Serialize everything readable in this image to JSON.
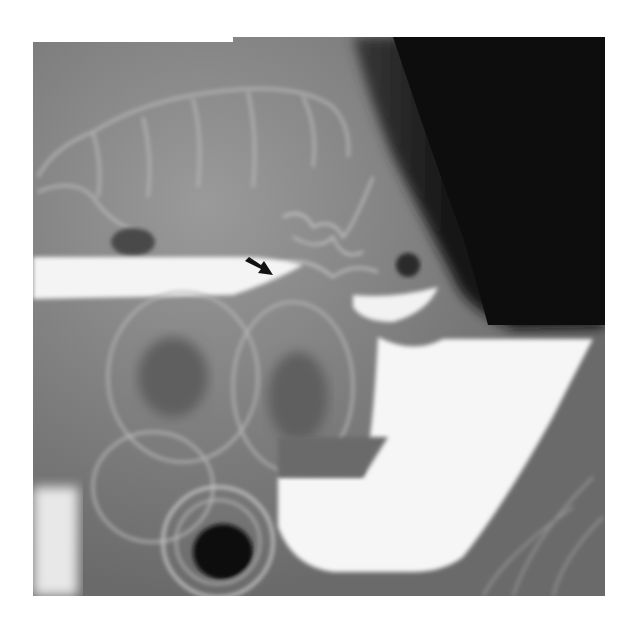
{
  "figure": {
    "type": "radiograph",
    "modality": "barium enema X-ray",
    "annotation": {
      "icon": "arrow-icon",
      "direction": "pointing down-right",
      "color": "#111111"
    },
    "colors": {
      "background": "#ffffff",
      "soft_tissue": "#7a7a7a",
      "barium": "#f7f7f7",
      "gas_dark": "#0e0e0e"
    }
  }
}
